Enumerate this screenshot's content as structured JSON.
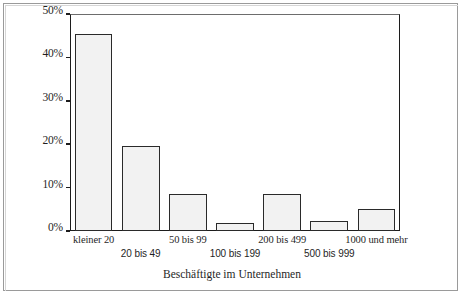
{
  "chart_data": {
    "type": "bar",
    "title": "",
    "subtitle": "",
    "xlabel": "Beschäftigte im Unternehmen",
    "ylabel": "",
    "categories": [
      "kleiner 20",
      "20 bis 49",
      "50 bis 99",
      "100 bis 199",
      "200 bis 499",
      "500 bis 999",
      "1000 und mehr"
    ],
    "values": [
      45.5,
      19.5,
      8.5,
      1.8,
      8.5,
      2.2,
      5.0
    ],
    "value_unit": "%",
    "ylim": [
      0,
      50
    ],
    "yticks": [
      0,
      10,
      20,
      30,
      40,
      50
    ],
    "ytick_labels": [
      "0%",
      "10%",
      "20%",
      "30%",
      "40%",
      "50%"
    ],
    "grid": false,
    "legend": null,
    "legend_position": "none",
    "bar_fill": "#d9d9d9",
    "bar_edge": "#2a2a2a",
    "axis_color": "#1c1c1c",
    "frame_color": "#9a9a9a",
    "label_rows": [
      0,
      1,
      0,
      1,
      0,
      1,
      0
    ],
    "annotations": []
  }
}
